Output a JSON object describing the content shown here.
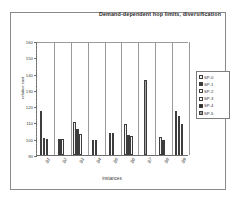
{
  "chart_data": {
    "type": "bar",
    "title": "Demand-dependent hop limits, diversification",
    "xlabel": "instances",
    "ylabel": "relative cost",
    "categories": [
      "g1",
      "g2",
      "g3",
      "g4",
      "g5",
      "g6",
      "g7",
      "g8",
      "g9"
    ],
    "ylim": [
      90,
      160
    ],
    "yticks": [
      90,
      100,
      110,
      120,
      130,
      140,
      150,
      160
    ],
    "grid": "vertical-category-separators",
    "legend_position": "right",
    "series": [
      {
        "name": "SP-0",
        "color": "#f2f2f2",
        "values": [
          117.0,
          null,
          110.2,
          null,
          null,
          109.0,
          null,
          101.2,
          117.3
        ]
      },
      {
        "name": "SP-1",
        "color": "#3a3a3a",
        "values": [
          100.2,
          99.6,
          106.2,
          99.5,
          103.4,
          102.3,
          null,
          99.2,
          114.0
        ]
      },
      {
        "name": "SP-2",
        "color": "#fafafa",
        "values": [
          100.1,
          99.6,
          103.0,
          99.4,
          103.6,
          101.6,
          null,
          null,
          109.2
        ]
      },
      {
        "name": "SP-3",
        "color": "#ffffff",
        "values": [
          null,
          null,
          null,
          null,
          null,
          null,
          null,
          null,
          null
        ]
      },
      {
        "name": "SP-4",
        "color": "#2b2b2b",
        "values": [
          null,
          null,
          null,
          null,
          null,
          null,
          null,
          null,
          null
        ]
      },
      {
        "name": "SP-5",
        "color": "#9e9e9e",
        "values": [
          null,
          null,
          null,
          null,
          null,
          null,
          136.0,
          null,
          null
        ]
      }
    ]
  },
  "legend": {
    "entries": [
      {
        "label": "SP-0",
        "color": "#f2f2f2"
      },
      {
        "label": "SP-1",
        "color": "#3a3a3a"
      },
      {
        "label": "SP-2",
        "color": "#fafafa"
      },
      {
        "label": "SP-3",
        "color": "#ffffff"
      },
      {
        "label": "SP-4",
        "color": "#2b2b2b"
      },
      {
        "label": "SP-5",
        "color": "#9e9e9e"
      }
    ]
  }
}
